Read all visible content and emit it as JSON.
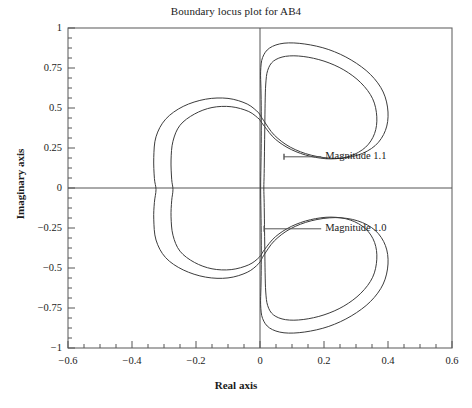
{
  "chart_data": {
    "type": "line",
    "title": "Boundary locus plot for AB4",
    "xlabel": "Real axis",
    "ylabel": "Imaginary axis",
    "xlim": [
      -0.6,
      0.6
    ],
    "ylim": [
      -1,
      1
    ],
    "grid": false,
    "legend_position": "inline-annotations",
    "xticks": [
      "-0.6",
      "-0.4",
      "-0.2",
      "0",
      "0.2",
      "0.4",
      "0.6"
    ],
    "xtick_values": [
      -0.6,
      -0.4,
      -0.2,
      0,
      0.2,
      0.4,
      0.6
    ],
    "yticks": [
      "1",
      "0.75",
      "0.5",
      "0.25",
      "0",
      "-0.25",
      "-0.5",
      "-0.75",
      "-1"
    ],
    "ytick_values": [
      1,
      0.75,
      0.5,
      0.25,
      0,
      -0.25,
      -0.5,
      -0.75,
      -1
    ],
    "minor_tick_subdivisions": 4,
    "series": [
      {
        "name": "Magnitude 1.1",
        "role": "outer-locus",
        "color": "#3c3c3c",
        "points": [
          [
            -0.004,
            0.47
          ],
          [
            -0.04,
            0.525
          ],
          [
            -0.1,
            0.56
          ],
          [
            -0.17,
            0.555
          ],
          [
            -0.24,
            0.51
          ],
          [
            -0.295,
            0.43
          ],
          [
            -0.325,
            0.32
          ],
          [
            -0.332,
            0.19
          ],
          [
            -0.33,
            0.06
          ],
          [
            -0.325,
            -0.01
          ],
          [
            -0.33,
            -0.09
          ],
          [
            -0.332,
            -0.195
          ],
          [
            -0.325,
            -0.325
          ],
          [
            -0.295,
            -0.435
          ],
          [
            -0.24,
            -0.512
          ],
          [
            -0.17,
            -0.557
          ],
          [
            -0.1,
            -0.562
          ],
          [
            -0.04,
            -0.527
          ],
          [
            -0.004,
            -0.472
          ],
          [
            0.012,
            -0.42
          ],
          [
            0.045,
            -0.33
          ],
          [
            0.095,
            -0.255
          ],
          [
            0.16,
            -0.205
          ],
          [
            0.235,
            -0.185
          ],
          [
            0.305,
            -0.205
          ],
          [
            0.36,
            -0.265
          ],
          [
            0.392,
            -0.36
          ],
          [
            0.4,
            -0.475
          ],
          [
            0.385,
            -0.6
          ],
          [
            0.345,
            -0.71
          ],
          [
            0.285,
            -0.8
          ],
          [
            0.215,
            -0.865
          ],
          [
            0.14,
            -0.9
          ],
          [
            0.075,
            -0.905
          ],
          [
            0.03,
            -0.875
          ],
          [
            0.008,
            -0.815
          ],
          [
            0.002,
            -0.73
          ],
          [
            0.003,
            -0.62
          ],
          [
            0.004,
            -0.48
          ],
          [
            0.004,
            -0.32
          ],
          [
            0.003,
            -0.15
          ],
          [
            0.002,
            0.0
          ],
          [
            0.003,
            0.15
          ],
          [
            0.004,
            0.32
          ],
          [
            0.004,
            0.48
          ],
          [
            0.003,
            0.62
          ],
          [
            0.002,
            0.73
          ],
          [
            0.008,
            0.815
          ],
          [
            0.03,
            0.875
          ],
          [
            0.075,
            0.905
          ],
          [
            0.14,
            0.9
          ],
          [
            0.215,
            0.865
          ],
          [
            0.285,
            0.8
          ],
          [
            0.345,
            0.71
          ],
          [
            0.385,
            0.6
          ],
          [
            0.4,
            0.475
          ],
          [
            0.392,
            0.36
          ],
          [
            0.36,
            0.265
          ],
          [
            0.305,
            0.205
          ],
          [
            0.235,
            0.185
          ],
          [
            0.16,
            0.205
          ],
          [
            0.095,
            0.255
          ],
          [
            0.045,
            0.33
          ],
          [
            0.012,
            0.42
          ],
          [
            -0.004,
            0.47
          ]
        ]
      },
      {
        "name": "Magnitude 1.0",
        "role": "inner-locus",
        "color": "#3c3c3c",
        "points": [
          [
            -0.002,
            0.43
          ],
          [
            -0.035,
            0.478
          ],
          [
            -0.09,
            0.508
          ],
          [
            -0.15,
            0.503
          ],
          [
            -0.205,
            0.462
          ],
          [
            -0.25,
            0.392
          ],
          [
            -0.272,
            0.292
          ],
          [
            -0.278,
            0.175
          ],
          [
            -0.276,
            0.055
          ],
          [
            -0.272,
            -0.01
          ],
          [
            -0.276,
            -0.08
          ],
          [
            -0.278,
            -0.18
          ],
          [
            -0.272,
            -0.295
          ],
          [
            -0.25,
            -0.395
          ],
          [
            -0.205,
            -0.465
          ],
          [
            -0.15,
            -0.505
          ],
          [
            -0.09,
            -0.51
          ],
          [
            -0.035,
            -0.48
          ],
          [
            -0.002,
            -0.432
          ],
          [
            0.014,
            -0.385
          ],
          [
            0.048,
            -0.305
          ],
          [
            0.098,
            -0.24
          ],
          [
            0.158,
            -0.198
          ],
          [
            0.222,
            -0.182
          ],
          [
            0.282,
            -0.2
          ],
          [
            0.33,
            -0.255
          ],
          [
            0.358,
            -0.34
          ],
          [
            0.365,
            -0.445
          ],
          [
            0.352,
            -0.558
          ],
          [
            0.315,
            -0.658
          ],
          [
            0.262,
            -0.738
          ],
          [
            0.2,
            -0.793
          ],
          [
            0.135,
            -0.822
          ],
          [
            0.08,
            -0.823
          ],
          [
            0.042,
            -0.793
          ],
          [
            0.024,
            -0.735
          ],
          [
            0.018,
            -0.65
          ],
          [
            0.016,
            -0.53
          ],
          [
            0.015,
            -0.38
          ],
          [
            0.014,
            -0.23
          ],
          [
            0.013,
            -0.09
          ],
          [
            0.012,
            0.0
          ],
          [
            0.013,
            0.09
          ],
          [
            0.014,
            0.23
          ],
          [
            0.015,
            0.38
          ],
          [
            0.016,
            0.53
          ],
          [
            0.018,
            0.65
          ],
          [
            0.024,
            0.735
          ],
          [
            0.042,
            0.793
          ],
          [
            0.08,
            0.823
          ],
          [
            0.135,
            0.822
          ],
          [
            0.2,
            0.793
          ],
          [
            0.262,
            0.738
          ],
          [
            0.315,
            0.658
          ],
          [
            0.352,
            0.558
          ],
          [
            0.365,
            0.445
          ],
          [
            0.358,
            0.34
          ],
          [
            0.33,
            0.255
          ],
          [
            0.282,
            0.2
          ],
          [
            0.222,
            0.182
          ],
          [
            0.158,
            0.198
          ],
          [
            0.098,
            0.24
          ],
          [
            0.048,
            0.305
          ],
          [
            0.014,
            0.385
          ],
          [
            -0.002,
            0.43
          ]
        ]
      }
    ],
    "annotations": [
      {
        "text": "Magnitude 1.1",
        "label_x": 0.085,
        "label_y": 0.195,
        "anchor_x": 0.075,
        "anchor_y": 0.195
      },
      {
        "text": "Magnitude 1.0",
        "label_x": 0.085,
        "label_y": -0.255,
        "anchor_x": 0.013,
        "anchor_y": -0.255
      }
    ]
  },
  "axes_style": {
    "frame_color": "#666666",
    "zero_line_color": "#555555",
    "tick_color": "#555555",
    "curve_color": "#3c3c3c",
    "text_color": "#1a1a1a"
  }
}
